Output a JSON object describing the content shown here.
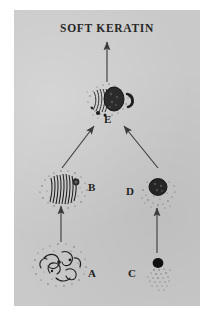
{
  "figure": {
    "title": "SOFT KERATIN",
    "background_color": "#c9c9c9",
    "ink_color": "#1f1f1f",
    "page_color": "#ffffff"
  },
  "labels": {
    "a": "A",
    "b": "B",
    "c": "C",
    "d": "D",
    "e": "E"
  },
  "stages": [
    {
      "key": "a",
      "label": "A",
      "icon": "cell-with-curly-fibrils-icon",
      "description": "large stippled cell containing curled tonofilament bundles"
    },
    {
      "key": "b",
      "label": "B",
      "icon": "cell-with-vertical-fibrils-icon",
      "description": "stippled cell with aligned vertical keratin fibrils"
    },
    {
      "key": "c",
      "label": "C",
      "icon": "small-dense-granule-icon",
      "description": "small solid dark granule with stippled tail"
    },
    {
      "key": "d",
      "label": "D",
      "icon": "dense-granule-with-halo-icon",
      "description": "dark rounded granule surrounded by stippled halo"
    },
    {
      "key": "e",
      "label": "E",
      "icon": "fused-keratin-cell-icon",
      "description": "flattened dark cell combining fibrils and granule material"
    }
  ],
  "arrows": [
    {
      "name": "arrow-a-to-b",
      "from": "A",
      "to": "B",
      "direction": "up"
    },
    {
      "name": "arrow-c-to-d",
      "from": "C",
      "to": "D",
      "direction": "up"
    },
    {
      "name": "arrow-b-to-e",
      "from": "B",
      "to": "E",
      "direction": "up-right"
    },
    {
      "name": "arrow-d-to-e",
      "from": "D",
      "to": "E",
      "direction": "up-left"
    },
    {
      "name": "arrow-e-to-title",
      "from": "E",
      "to": "SOFT KERATIN",
      "direction": "up"
    }
  ]
}
